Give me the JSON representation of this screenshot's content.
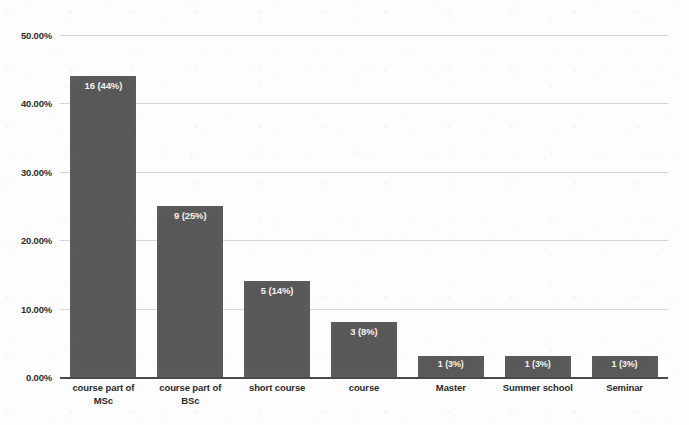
{
  "chart_data": {
    "type": "bar",
    "title": "",
    "xlabel": "",
    "ylabel": "",
    "ylim": [
      0,
      50
    ],
    "ytick_labels": [
      "50.00%",
      "40.00%",
      "30.00%",
      "20.00%",
      "10.00%",
      "0.00%"
    ],
    "ytick_values": [
      50,
      40,
      30,
      20,
      10,
      0
    ],
    "grid": true,
    "legend": "none",
    "categories": [
      "course part of MSc",
      "course part of BSc",
      "short course",
      "course",
      "Master",
      "Summer school",
      "Seminar"
    ],
    "category_lines": [
      [
        "course part of",
        "MSc"
      ],
      [
        "course part of",
        "BSc"
      ],
      [
        "short course"
      ],
      [
        "course"
      ],
      [
        "Master"
      ],
      [
        "Summer school"
      ],
      [
        "Seminar"
      ]
    ],
    "values": [
      44,
      25,
      14,
      8,
      3,
      3,
      3
    ],
    "counts": [
      16,
      9,
      5,
      3,
      1,
      1,
      1
    ],
    "data_labels": [
      "16 (44%)",
      "9 (25%)",
      "5 (14%)",
      "3 (8%)",
      "1 (3%)",
      "1 (3%)",
      "1 (3%)"
    ],
    "colors": {
      "bar": "#585858",
      "bar_label_text": "#f2f2f2",
      "gridline": "#d6d6d6",
      "axis": "#4a4a4a",
      "tick_text": "#2e2e2e",
      "background": "#fdfdfd"
    }
  }
}
